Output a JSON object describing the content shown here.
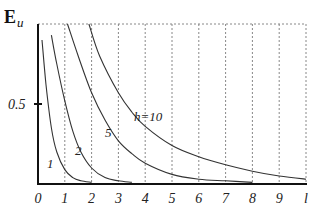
{
  "chart_data": {
    "type": "line",
    "title": "",
    "xlabel": "l",
    "ylabel": "E_u",
    "ylabel_main": "E",
    "ylabel_sub": "u",
    "x_ticks": [
      "0",
      "1",
      "2",
      "3",
      "4",
      "5",
      "6",
      "7",
      "8",
      "9",
      "l"
    ],
    "y_ticks": [
      "0.5"
    ],
    "xlim": [
      0,
      10
    ],
    "ylim": [
      0,
      1
    ],
    "grid": "vertical dashed at integer x, dashed top border",
    "legend": "none (curves labeled inline)",
    "series": [
      {
        "name": "1",
        "label": "1",
        "x": [
          0.15,
          0.3,
          0.5,
          0.7,
          1.0,
          1.3,
          1.6,
          2.0
        ],
        "y": [
          0.9,
          0.62,
          0.35,
          0.2,
          0.09,
          0.04,
          0.02,
          0.01
        ]
      },
      {
        "name": "2",
        "label": "2",
        "x": [
          0.5,
          0.7,
          1.0,
          1.3,
          1.6,
          2.0,
          2.5,
          3.0,
          3.5
        ],
        "y": [
          0.93,
          0.75,
          0.52,
          0.33,
          0.2,
          0.1,
          0.04,
          0.02,
          0.01
        ]
      },
      {
        "name": "5",
        "label": "5",
        "x": [
          1.1,
          1.5,
          2.0,
          2.5,
          3.0,
          3.5,
          4.0,
          5.0,
          6.0,
          7.0,
          8.0
        ],
        "y": [
          1.0,
          0.8,
          0.57,
          0.4,
          0.27,
          0.19,
          0.13,
          0.06,
          0.03,
          0.02,
          0.01
        ]
      },
      {
        "name": "h=10",
        "label": "h=10",
        "x": [
          1.9,
          2.3,
          3.0,
          3.5,
          4.0,
          5.0,
          6.0,
          7.0,
          8.0,
          9.0,
          10.0
        ],
        "y": [
          1.0,
          0.8,
          0.57,
          0.45,
          0.36,
          0.24,
          0.17,
          0.12,
          0.08,
          0.05,
          0.03
        ]
      }
    ]
  },
  "labels": {
    "curve_1": "1",
    "curve_2": "2",
    "curve_5": "5",
    "curve_10": "h=10"
  }
}
